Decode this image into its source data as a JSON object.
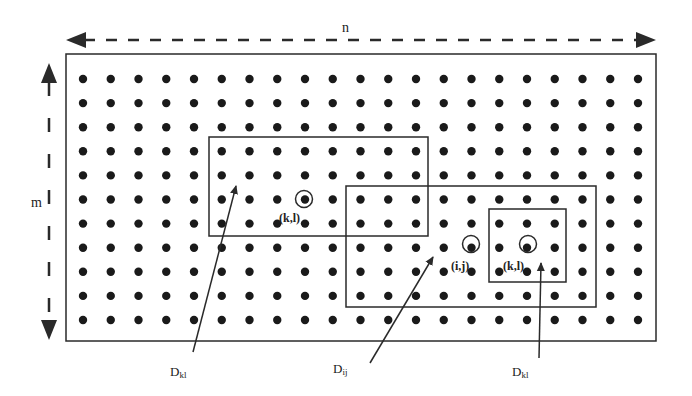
{
  "diagram": {
    "dimension_labels": {
      "width": "n",
      "height": "m"
    },
    "grid": {
      "rows": 11,
      "cols": 21,
      "x0": 83,
      "y0": 79,
      "dx": 27.75,
      "dy": 24.1,
      "dot_radius": 4.2,
      "dot_color": "#1a1a1a"
    },
    "outer_rect": {
      "x": 66,
      "y": 54,
      "w": 590,
      "h": 287
    },
    "windows": [
      {
        "id": "D_kl_left",
        "x": 209,
        "y": 137,
        "w": 219,
        "h": 99
      },
      {
        "id": "D_ij",
        "x": 346,
        "y": 186,
        "w": 250,
        "h": 121
      },
      {
        "id": "D_kl_right",
        "x": 489,
        "y": 209,
        "w": 77,
        "h": 73
      }
    ],
    "circled_points": [
      {
        "cx": 304,
        "cy": 199,
        "label": "(k,l)",
        "lx": 279,
        "ly": 222
      },
      {
        "cx": 471,
        "cy": 244,
        "label": "(i,j)",
        "lx": 451,
        "ly": 270
      },
      {
        "cx": 528,
        "cy": 244,
        "label": "(k,l)",
        "lx": 503,
        "ly": 270
      }
    ],
    "pointers": [
      {
        "label_main": "D",
        "label_sub": "kl",
        "lx": 170,
        "ly": 376,
        "x1": 193,
        "y1": 352,
        "x2": 236,
        "y2": 186
      },
      {
        "label_main": "D",
        "label_sub": "ij",
        "lx": 333,
        "ly": 373,
        "x1": 370,
        "y1": 363,
        "x2": 433,
        "y2": 257
      },
      {
        "label_main": "D",
        "label_sub": "kl",
        "lx": 512,
        "ly": 376,
        "x1": 539,
        "y1": 358,
        "x2": 541,
        "y2": 263
      }
    ],
    "colors": {
      "line": "#2a2a2a",
      "dot": "#1a1a1a",
      "background": "#ffffff"
    }
  }
}
